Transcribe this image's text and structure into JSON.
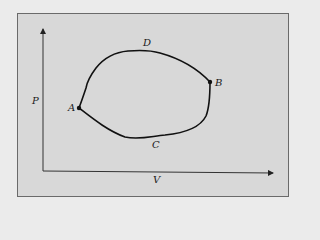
{
  "diagram": {
    "type": "pv-cycle",
    "axes": {
      "x_label": "V",
      "y_label": "P"
    },
    "points": [
      {
        "id": "A",
        "label": "A",
        "role": "state-point"
      },
      {
        "id": "B",
        "label": "B",
        "role": "state-point"
      }
    ],
    "path_labels": [
      {
        "id": "D",
        "label": "D",
        "position": "upper-path"
      },
      {
        "id": "C",
        "label": "C",
        "position": "lower-path"
      }
    ],
    "colors": {
      "background": "#ebebeb",
      "panel": "#d8d8d8",
      "ink": "#111111"
    }
  }
}
